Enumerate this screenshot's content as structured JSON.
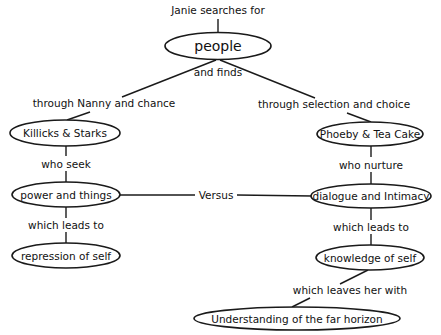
{
  "diagram": {
    "title": "Janie searches for",
    "nodes": {
      "people": "people",
      "killicks": "Killicks & Starks",
      "phoeby": "Phoeby & Tea Cake",
      "power": "power and things",
      "dialogue": "dialogue and Intimacy",
      "repression": "repression of self",
      "knowledge": "knowledge of self",
      "understanding": "Understanding of the far horizon"
    },
    "links": {
      "and_finds": "and finds",
      "nanny": "through Nanny and chance",
      "selection": "through selection and choice",
      "who_seek": "who seek",
      "who_nurture": "who nurture",
      "versus": "Versus",
      "leads_left": "which leads to",
      "leads_right": "which leads to",
      "leaves": "which leaves her with"
    },
    "colors": {
      "stroke": "#1a1a1a",
      "text": "#111111",
      "background": "#ffffff"
    }
  }
}
